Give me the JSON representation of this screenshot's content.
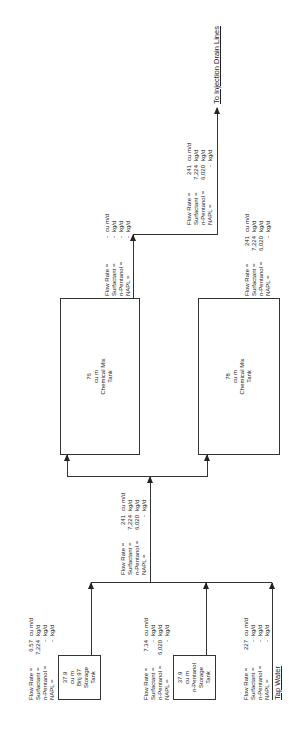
{
  "diagram": {
    "orientation": "rotated 90 degrees counter-clockwise",
    "sources": [
      {
        "id": "brij97-tank",
        "lines": [
          "37.9",
          "cu m",
          "Brij 97",
          "Storage",
          "Tank"
        ],
        "flow": {
          "rows": [
            {
              "key": "Flow Rate =",
              "value": "6.57",
              "unit": "cu m/d"
            },
            {
              "key": "Surfactant =",
              "value": "7,224",
              "unit": "kg/d"
            },
            {
              "key": "n-Pentanol =",
              "value": "-",
              "unit": "kg/d"
            },
            {
              "key": "NAPL =",
              "value": "-",
              "unit": "kg/d"
            }
          ]
        }
      },
      {
        "id": "pentanol-tank",
        "lines": [
          "37.9",
          "cu m",
          "n-Pentanol",
          "Storage",
          "Tank"
        ],
        "flow": {
          "rows": [
            {
              "key": "Flow Rate =",
              "value": "7.34",
              "unit": "cu m/d"
            },
            {
              "key": "Surfactant =",
              "value": "-",
              "unit": "kg/d"
            },
            {
              "key": "n-Pentanol =",
              "value": "6,020",
              "unit": "kg/d"
            },
            {
              "key": "NAPL =",
              "value": "-",
              "unit": "kg/d"
            }
          ]
        }
      },
      {
        "id": "tap-water",
        "label": "Tap Water",
        "flow": {
          "rows": [
            {
              "key": "Flow Rate =",
              "value": "227",
              "unit": "cu m/d"
            },
            {
              "key": "Surfactant =",
              "value": "-",
              "unit": "kg/d"
            },
            {
              "key": "n-Pentanol =",
              "value": "-",
              "unit": "kg/d"
            },
            {
              "key": "NAPL =",
              "value": "-",
              "unit": "kg/d"
            }
          ]
        }
      }
    ],
    "combined_flow": {
      "rows": [
        {
          "key": "Flow Rate =",
          "value": "241",
          "unit": "cu m/d"
        },
        {
          "key": "Surfactant =",
          "value": "7,224",
          "unit": "kg/d"
        },
        {
          "key": "n-Pentanol =",
          "value": "6,020",
          "unit": "kg/d"
        },
        {
          "key": "NAPL =",
          "value": "-",
          "unit": "kg/d"
        }
      ]
    },
    "mix_tanks": [
      {
        "id": "mix-tank-a",
        "lines": [
          "76",
          "cu m",
          "Chemical Mix",
          "Tank"
        ],
        "flow": {
          "rows": [
            {
              "key": "Flow Rate =",
              "value": "-",
              "unit": "cu m/d"
            },
            {
              "key": "Surfactant =",
              "value": "-",
              "unit": "kg/d"
            },
            {
              "key": "n-Pentanol =",
              "value": "-",
              "unit": "kg/d"
            },
            {
              "key": "NAPL =",
              "value": "-",
              "unit": "kg/d"
            }
          ]
        }
      },
      {
        "id": "mix-tank-b",
        "lines": [
          "78",
          "cu m",
          "Chemical Mix",
          "Tank"
        ],
        "flow": {
          "rows": [
            {
              "key": "Flow Rate =",
              "value": "241",
              "unit": "cu m/d"
            },
            {
              "key": "Surfactant =",
              "value": "7,224",
              "unit": "kg/d"
            },
            {
              "key": "n-Pentanol =",
              "value": "6,020",
              "unit": "kg/d"
            },
            {
              "key": "NAPL =",
              "value": "-",
              "unit": "kg/d"
            }
          ]
        }
      }
    ],
    "output_flow": {
      "rows": [
        {
          "key": "Flow Rate =",
          "value": "241",
          "unit": "cu m/d"
        },
        {
          "key": "Surfactant =",
          "value": "7,224",
          "unit": "kg/d"
        },
        {
          "key": "n-Pentanol =",
          "value": "6,020",
          "unit": "kg/d"
        },
        {
          "key": "NAPL =",
          "value": "-",
          "unit": "kg/d"
        }
      ]
    },
    "destination": {
      "label": "To Injection Drain Lines"
    }
  }
}
